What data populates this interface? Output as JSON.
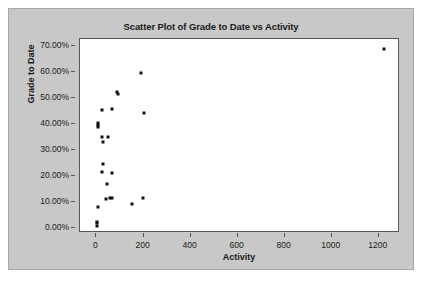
{
  "chart_data": {
    "type": "scatter",
    "title": "Scatter Plot of Grade to Date vs Activity",
    "xlabel": "Activity",
    "ylabel": "Grade to Date",
    "xlim": [
      -70,
      1290
    ],
    "ylim": [
      -0.02,
      0.725
    ],
    "grid": false,
    "legend": null,
    "xticks": [
      0,
      200,
      400,
      600,
      800,
      1000,
      1200
    ],
    "xtick_labels": [
      "0",
      "200",
      "400",
      "600",
      "800",
      "1000",
      "1200"
    ],
    "yticks": [
      0.0,
      0.1,
      0.2,
      0.3,
      0.4,
      0.5,
      0.6,
      0.7
    ],
    "ytick_labels": [
      "0.00%",
      "10.00%",
      "20.00%",
      "30.00%",
      "40.00%",
      "50.00%",
      "60.00%",
      "70.00%"
    ],
    "marker": "square",
    "marker_color": "#111111",
    "marker_size": 3,
    "points": [
      {
        "x": 1220,
        "y": 0.685
      },
      {
        "x": 188,
        "y": 0.595
      },
      {
        "x": 88,
        "y": 0.522
      },
      {
        "x": 90,
        "y": 0.512
      },
      {
        "x": 22,
        "y": 0.453
      },
      {
        "x": 68,
        "y": 0.455
      },
      {
        "x": 200,
        "y": 0.44
      },
      {
        "x": 6,
        "y": 0.404
      },
      {
        "x": 6,
        "y": 0.396
      },
      {
        "x": 6,
        "y": 0.388
      },
      {
        "x": 22,
        "y": 0.348
      },
      {
        "x": 48,
        "y": 0.348
      },
      {
        "x": 26,
        "y": 0.328
      },
      {
        "x": 26,
        "y": 0.245
      },
      {
        "x": 22,
        "y": 0.215
      },
      {
        "x": 66,
        "y": 0.212
      },
      {
        "x": 46,
        "y": 0.17
      },
      {
        "x": 40,
        "y": 0.112
      },
      {
        "x": 58,
        "y": 0.113
      },
      {
        "x": 64,
        "y": 0.113
      },
      {
        "x": 196,
        "y": 0.116
      },
      {
        "x": 150,
        "y": 0.09
      },
      {
        "x": 8,
        "y": 0.078
      },
      {
        "x": 4,
        "y": 0.024
      },
      {
        "x": 4,
        "y": 0.018
      },
      {
        "x": 4,
        "y": 0.008
      }
    ]
  },
  "colors": {
    "panel_background": "#c8c8c8",
    "plot_background": "#ffffff",
    "axis": "#555555",
    "text": "#1a1a1a",
    "marker": "#111111"
  }
}
